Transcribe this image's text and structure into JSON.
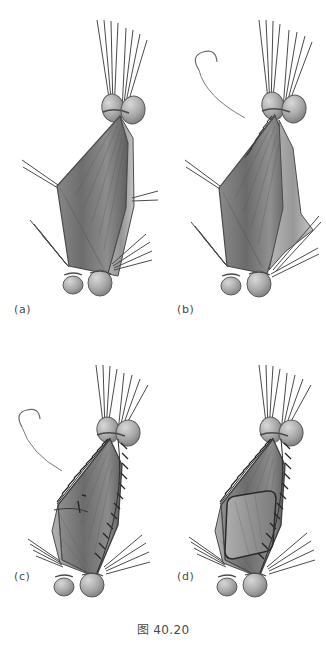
{
  "figure": {
    "caption": "图 40.20",
    "background_color": "#ffffff",
    "ink_color": "#3a3a3a",
    "tissue_colors": {
      "light": "#c9c9c9",
      "mid": "#9a9a9a",
      "dark": "#6f6f6f",
      "shadow": "#565656",
      "highlight": "#e2e2e2"
    },
    "panels": [
      {
        "id": "a",
        "label": "(a)",
        "description": "Tissue flap held open by clamps with suture bundles, no stitches placed",
        "clamp_count_top": 2,
        "clamp_count_bottom": 2,
        "suture_bundles": 4,
        "stitch_edges": 0,
        "has_needle": false,
        "has_inner_graft": false
      },
      {
        "id": "b",
        "label": "(b)",
        "description": "Curved needle with suture begins closure along upper edge; flap partly everted",
        "clamp_count_top": 2,
        "clamp_count_bottom": 2,
        "suture_bundles": 4,
        "stitch_edges": 1,
        "has_needle": true,
        "has_inner_graft": false
      },
      {
        "id": "c",
        "label": "(c)",
        "description": "Running suture line continues down both lateral edges of the flap",
        "clamp_count_top": 2,
        "clamp_count_bottom": 2,
        "suture_bundles": 4,
        "stitch_edges": 2,
        "has_needle": true,
        "has_inner_graft": false
      },
      {
        "id": "d",
        "label": "(d)",
        "description": "Closure complete on both edges; inner rectangular graft patch seated in flap",
        "clamp_count_top": 2,
        "clamp_count_bottom": 2,
        "suture_bundles": 4,
        "stitch_edges": 2,
        "has_needle": false,
        "has_inner_graft": true
      }
    ]
  }
}
